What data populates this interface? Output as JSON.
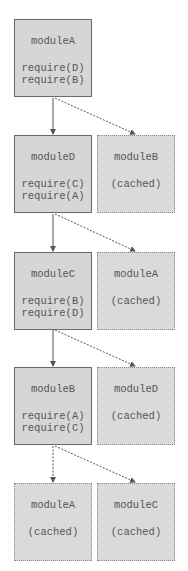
{
  "diagram": {
    "rows": [
      {
        "module": {
          "name": "moduleA",
          "requires": [
            "require(D)",
            "require(B)"
          ]
        }
      },
      {
        "module": {
          "name": "moduleD",
          "requires": [
            "require(C)",
            "require(A)"
          ]
        },
        "cached": {
          "name": "moduleB",
          "label": "(cached)"
        }
      },
      {
        "module": {
          "name": "moduleC",
          "requires": [
            "require(B)",
            "require(D)"
          ]
        },
        "cached": {
          "name": "moduleA",
          "label": "(cached)"
        }
      },
      {
        "module": {
          "name": "moduleB",
          "requires": [
            "require(A)",
            "require(C)"
          ]
        },
        "cached": {
          "name": "moduleD",
          "label": "(cached)"
        }
      },
      {
        "cached_left": {
          "name": "moduleA",
          "label": "(cached)"
        },
        "cached": {
          "name": "moduleC",
          "label": "(cached)"
        }
      }
    ],
    "colors": {
      "box_fill": "#d6d6d6",
      "border": "#6a6a6a",
      "text": "#555555"
    }
  }
}
